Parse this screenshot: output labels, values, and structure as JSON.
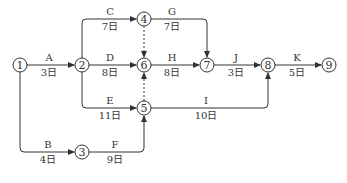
{
  "diagram": {
    "type": "activity-on-arrow network",
    "nodes": [
      {
        "id": "1",
        "x": 20,
        "y": 65
      },
      {
        "id": "2",
        "x": 82,
        "y": 65
      },
      {
        "id": "3",
        "x": 82,
        "y": 152
      },
      {
        "id": "4",
        "x": 144,
        "y": 19
      },
      {
        "id": "5",
        "x": 144,
        "y": 108
      },
      {
        "id": "6",
        "x": 144,
        "y": 65
      },
      {
        "id": "7",
        "x": 207,
        "y": 65
      },
      {
        "id": "8",
        "x": 268,
        "y": 65
      },
      {
        "id": "9",
        "x": 329,
        "y": 65
      }
    ],
    "activities": [
      {
        "name": "A",
        "duration": "3日",
        "from": "1",
        "to": "2"
      },
      {
        "name": "B",
        "duration": "4日",
        "from": "1",
        "to": "3"
      },
      {
        "name": "C",
        "duration": "7日",
        "from": "2",
        "to": "4"
      },
      {
        "name": "D",
        "duration": "8日",
        "from": "2",
        "to": "6"
      },
      {
        "name": "E",
        "duration": "11日",
        "from": "2",
        "to": "5"
      },
      {
        "name": "F",
        "duration": "9日",
        "from": "3",
        "to": "5"
      },
      {
        "name": "G",
        "duration": "7日",
        "from": "4",
        "to": "7"
      },
      {
        "name": "H",
        "duration": "8日",
        "from": "6",
        "to": "7"
      },
      {
        "name": "I",
        "duration": "10日",
        "from": "5",
        "to": "8"
      },
      {
        "name": "J",
        "duration": "3日",
        "from": "7",
        "to": "8"
      },
      {
        "name": "K",
        "duration": "5日",
        "from": "8",
        "to": "9"
      }
    ],
    "dummies": [
      {
        "from": "4",
        "to": "6"
      },
      {
        "from": "5",
        "to": "6"
      }
    ]
  }
}
